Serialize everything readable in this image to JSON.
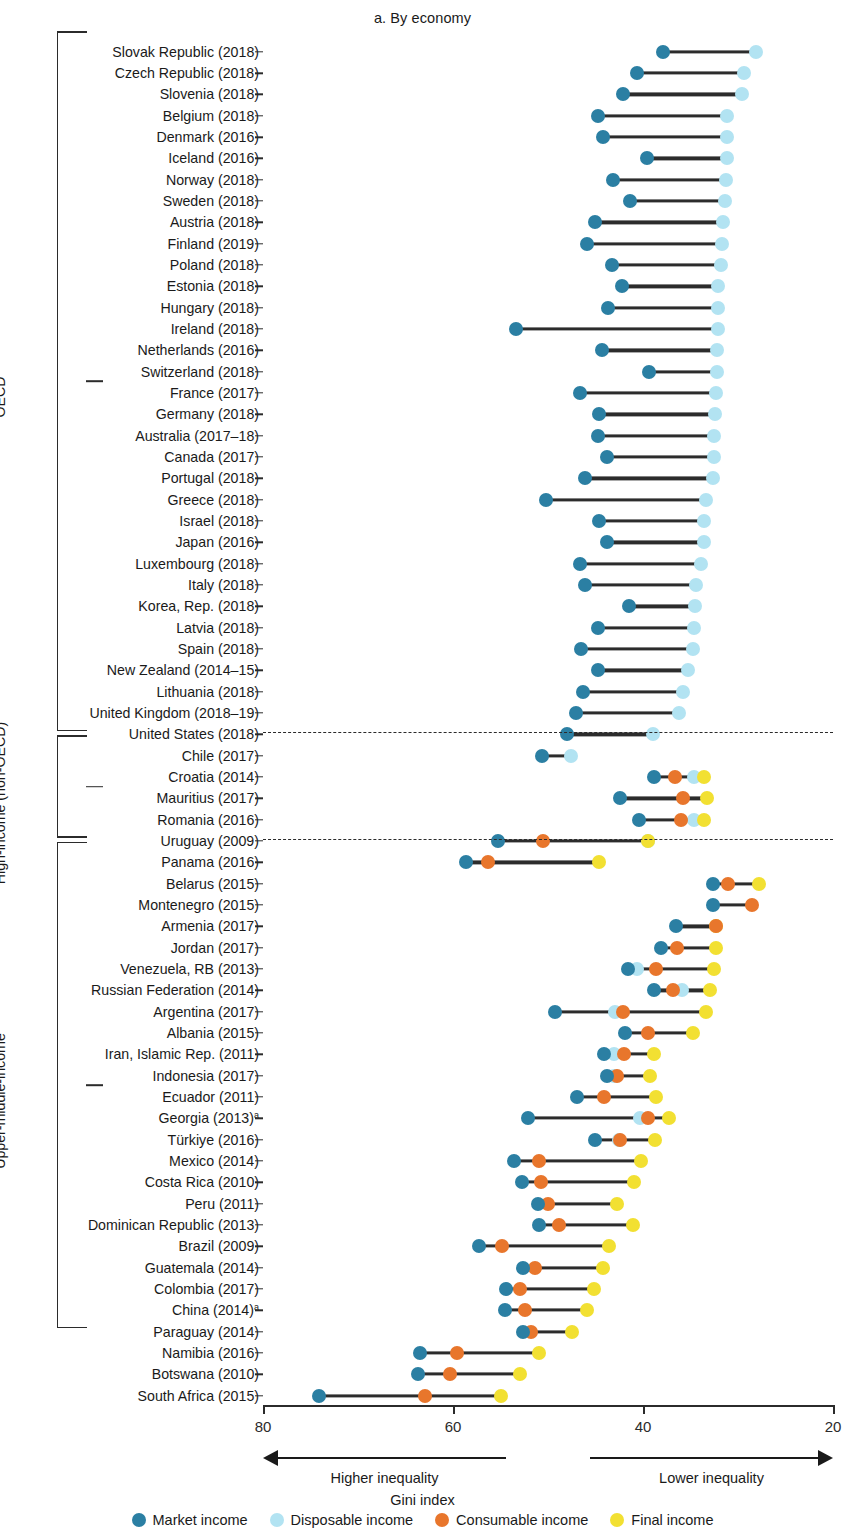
{
  "panel": {
    "title": "a. By economy"
  },
  "axis": {
    "title": "Gini index",
    "ticks": [
      80,
      60,
      40,
      20
    ],
    "min": 20,
    "max": 80,
    "reversed": true,
    "left_caption": "Higher inequality",
    "right_caption": "Lower inequality"
  },
  "legend": [
    {
      "label": "Market income",
      "color": "#2b7fa3",
      "key": "market"
    },
    {
      "label": "Disposable income",
      "color": "#b2e3f2",
      "key": "disposable"
    },
    {
      "label": "Consumable income",
      "color": "#e8762c",
      "key": "consumable"
    },
    {
      "label": "Final income",
      "color": "#f2e032",
      "key": "final"
    }
  ],
  "groups": [
    {
      "label": "OECD",
      "start": 0,
      "end": 32
    },
    {
      "label": "High-income (non-OECD)",
      "start": 33,
      "end": 37
    },
    {
      "label": "Upper-middle-income",
      "start": 38,
      "end": 60
    }
  ],
  "chart_data": {
    "type": "scatter",
    "title": "a. By economy",
    "xlabel": "Gini index",
    "ylabel": "",
    "xlim": [
      80,
      20
    ],
    "grid": false,
    "legend_position": "bottom",
    "series": [
      "market",
      "disposable",
      "consumable",
      "final"
    ],
    "rows": [
      {
        "label": "Slovak Republic (2018)",
        "market": 37.9,
        "disposable": 28.1
      },
      {
        "label": "Czech Republic (2018)",
        "market": 40.6,
        "disposable": 29.4
      },
      {
        "label": "Slovenia (2018)",
        "market": 42.1,
        "disposable": 29.6
      },
      {
        "label": "Belgium (2018)",
        "market": 44.7,
        "disposable": 31.2
      },
      {
        "label": "Denmark (2016)",
        "market": 44.2,
        "disposable": 31.2
      },
      {
        "label": "Iceland (2016)",
        "market": 39.6,
        "disposable": 31.2
      },
      {
        "label": "Norway (2018)",
        "market": 43.2,
        "disposable": 31.3
      },
      {
        "label": "Sweden (2018)",
        "market": 41.4,
        "disposable": 31.4
      },
      {
        "label": "Austria (2018)",
        "market": 45.1,
        "disposable": 31.6
      },
      {
        "label": "Finland (2019)",
        "market": 45.9,
        "disposable": 31.7
      },
      {
        "label": "Poland (2018)",
        "market": 43.3,
        "disposable": 31.8
      },
      {
        "label": "Estonia (2018)",
        "market": 42.2,
        "disposable": 32.1
      },
      {
        "label": "Hungary (2018)",
        "market": 43.7,
        "disposable": 32.1
      },
      {
        "label": "Ireland (2018)",
        "market": 53.4,
        "disposable": 32.1
      },
      {
        "label": "Netherlands (2016)",
        "market": 44.3,
        "disposable": 32.2
      },
      {
        "label": "Switzerland (2018)",
        "market": 39.4,
        "disposable": 32.2
      },
      {
        "label": "France (2017)",
        "market": 46.6,
        "disposable": 32.3
      },
      {
        "label": "Germany (2018)",
        "market": 44.6,
        "disposable": 32.4
      },
      {
        "label": "Australia (2017–18)",
        "market": 44.7,
        "disposable": 32.5
      },
      {
        "label": "Canada (2017)",
        "market": 43.8,
        "disposable": 32.5
      },
      {
        "label": "Portugal (2018)",
        "market": 46.1,
        "disposable": 32.6
      },
      {
        "label": "Greece (2018)",
        "market": 50.2,
        "disposable": 33.4
      },
      {
        "label": "Israel (2018)",
        "market": 44.6,
        "disposable": 33.6
      },
      {
        "label": "Japan (2016)",
        "market": 43.8,
        "disposable": 33.6
      },
      {
        "label": "Luxembourg (2018)",
        "market": 46.6,
        "disposable": 33.9
      },
      {
        "label": "Italy (2018)",
        "market": 46.1,
        "disposable": 34.4
      },
      {
        "label": "Korea, Rep. (2018)",
        "market": 41.5,
        "disposable": 34.5
      },
      {
        "label": "Latvia (2018)",
        "market": 44.7,
        "disposable": 34.6
      },
      {
        "label": "Spain (2018)",
        "market": 46.5,
        "disposable": 34.7
      },
      {
        "label": "New Zealand (2014–15)",
        "market": 44.7,
        "disposable": 35.3
      },
      {
        "label": "Lithuania (2018)",
        "market": 46.3,
        "disposable": 35.8
      },
      {
        "label": "United Kingdom (2018–19)",
        "market": 47.1,
        "disposable": 36.2
      },
      {
        "label": "United States (2018)",
        "market": 48.0,
        "disposable": 39.0
      },
      {
        "label": "Chile (2017)",
        "market": 50.6,
        "disposable": 47.6
      },
      {
        "label": "Croatia (2014)",
        "market": 38.8,
        "disposable": 34.6,
        "consumable": 36.6,
        "final": 33.6
      },
      {
        "label": "Mauritius (2017)",
        "market": 42.4,
        "disposable": null,
        "consumable": 35.8,
        "final": 33.3
      },
      {
        "label": "Romania (2016)",
        "market": 40.4,
        "disposable": 34.6,
        "consumable": 36.0,
        "final": 33.6
      },
      {
        "label": "Uruguay (2009)",
        "market": 55.3,
        "disposable": 39.5,
        "consumable": 50.5,
        "final": 39.5
      },
      {
        "label": "Panama (2016)",
        "market": 58.6,
        "disposable": null,
        "consumable": 56.3,
        "final": 44.6
      },
      {
        "label": "Belarus (2015)",
        "market": 32.6,
        "disposable": null,
        "consumable": 31.1,
        "final": 27.8
      },
      {
        "label": "Montenegro (2015)",
        "market": 32.6,
        "disposable": null,
        "consumable": 28.5,
        "final": null
      },
      {
        "label": "Armenia (2017)",
        "market": 36.5,
        "disposable": null,
        "consumable": 32.3,
        "final": 32.3
      },
      {
        "label": "Jordan (2017)",
        "market": 38.1,
        "disposable": null,
        "consumable": 36.4,
        "final": 32.3
      },
      {
        "label": "Venezuela, RB (2013)",
        "market": 41.6,
        "disposable": 40.6,
        "consumable": 38.6,
        "final": 32.5
      },
      {
        "label": "Russian Federation (2014)",
        "market": 38.8,
        "disposable": 35.9,
        "consumable": 36.8,
        "final": 32.9
      },
      {
        "label": "Argentina (2017)",
        "market": 49.3,
        "disposable": 43.0,
        "consumable": 42.1,
        "final": 33.4
      },
      {
        "label": "Albania (2015)",
        "market": 41.9,
        "disposable": null,
        "consumable": 39.5,
        "final": 34.7
      },
      {
        "label": "Iran, Islamic Rep. (2011)",
        "market": 44.1,
        "disposable": 43.1,
        "consumable": 42.0,
        "final": 38.8
      },
      {
        "label": "Indonesia (2017)",
        "market": 43.8,
        "disposable": 43.1,
        "consumable": 42.7,
        "final": 39.3
      },
      {
        "label": "Ecuador (2011)",
        "market": 46.9,
        "disposable": null,
        "consumable": 44.1,
        "final": 38.6
      },
      {
        "label": "Georgia (2013)",
        "sup": "a",
        "market": 52.1,
        "disposable": 40.3,
        "consumable": 39.5,
        "final": 37.3
      },
      {
        "label": "Türkiye (2016)",
        "market": 45.1,
        "disposable": 42.5,
        "consumable": 42.4,
        "final": 38.7
      },
      {
        "label": "Mexico (2014)",
        "market": 53.6,
        "disposable": null,
        "consumable": 51.0,
        "final": 40.2
      },
      {
        "label": "Costa Rica (2010)",
        "market": 52.7,
        "disposable": null,
        "consumable": 50.7,
        "final": 40.9
      },
      {
        "label": "Peru (2011)",
        "market": 51.1,
        "disposable": null,
        "consumable": 50.0,
        "final": 42.7
      },
      {
        "label": "Dominican Republic (2013)",
        "market": 50.9,
        "disposable": null,
        "consumable": 48.8,
        "final": 41.1
      },
      {
        "label": "Brazil (2009)",
        "market": 57.3,
        "disposable": null,
        "consumable": 54.8,
        "final": 43.6
      },
      {
        "label": "Guatemala (2014)",
        "market": 52.6,
        "disposable": null,
        "consumable": 51.4,
        "final": 44.2
      },
      {
        "label": "Colombia (2017)",
        "market": 54.4,
        "disposable": null,
        "consumable": 53.0,
        "final": 45.2
      },
      {
        "label": "China (2014)",
        "sup": "a",
        "market": 54.5,
        "disposable": null,
        "consumable": 52.4,
        "final": 45.9
      },
      {
        "label": "Paraguay (2014)",
        "market": 52.6,
        "disposable": null,
        "consumable": 51.8,
        "final": 47.5
      },
      {
        "label": "Namibia (2016)",
        "market": 63.5,
        "disposable": null,
        "consumable": 59.6,
        "final": 51.0
      },
      {
        "label": "Botswana (2010)",
        "market": 63.7,
        "disposable": null,
        "consumable": 60.3,
        "final": 53.0
      },
      {
        "label": "South Africa (2015)",
        "market": 74.1,
        "disposable": null,
        "consumable": 63.0,
        "final": 55.0
      }
    ]
  }
}
